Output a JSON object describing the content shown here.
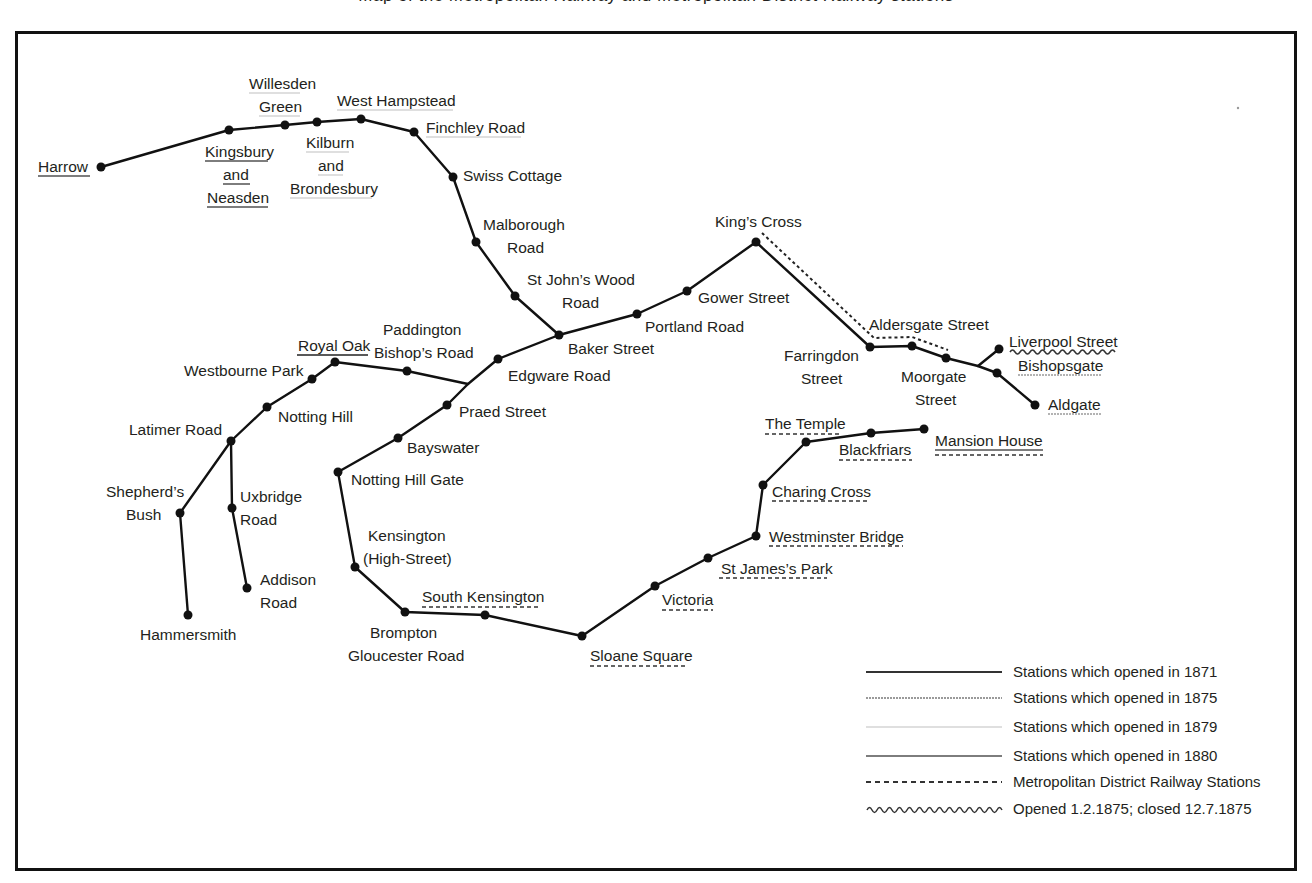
{
  "caption_cropped": "Map of the Metropolitan Railway and Metropolitan District Railway stations",
  "colors": {
    "frame": "#111111",
    "track": "#111111",
    "y1875": "#9a9a9a",
    "y1879": "#d4d4d4",
    "y1880": "#7d7d7d",
    "district_dash": "#333333",
    "closed_wave": "#333333"
  },
  "stations": [
    {
      "name": "Harrow",
      "lines": [
        "Harrow"
      ],
      "opened": "1880"
    },
    {
      "name": "Kingsbury and Neasden",
      "lines": [
        "Kingsbury",
        "and",
        "Neasden"
      ],
      "opened": "1880"
    },
    {
      "name": "Willesden Green",
      "lines": [
        "Willesden",
        "Green"
      ],
      "opened": "1879"
    },
    {
      "name": "Kilburn and Brondesbury",
      "lines": [
        "Kilburn",
        "and",
        "Brondesbury"
      ],
      "opened": "1879"
    },
    {
      "name": "West Hampstead",
      "lines": [
        "West Hampstead"
      ],
      "opened": "1879"
    },
    {
      "name": "Finchley Road",
      "lines": [
        "Finchley Road"
      ],
      "opened": "1879"
    },
    {
      "name": "Swiss Cottage",
      "lines": [
        "Swiss Cottage"
      ],
      "opened": "1871"
    },
    {
      "name": "Malborough Road",
      "lines": [
        "Malborough",
        "Road"
      ],
      "opened": "1871"
    },
    {
      "name": "St John's Wood Road",
      "lines": [
        "St John’s Wood",
        "Road"
      ],
      "opened": "1871"
    },
    {
      "name": "Baker Street",
      "lines": [
        "Baker Street"
      ],
      "opened": "1871"
    },
    {
      "name": "Portland Road",
      "lines": [
        "Portland Road"
      ],
      "opened": "1871"
    },
    {
      "name": "Gower Street",
      "lines": [
        "Gower Street"
      ],
      "opened": "1871"
    },
    {
      "name": "King's Cross",
      "lines": [
        "King’s Cross"
      ],
      "opened": "1871"
    },
    {
      "name": "Farringdon Street",
      "lines": [
        "Farringdon",
        "Street"
      ],
      "opened": "1871"
    },
    {
      "name": "Aldersgate Street",
      "lines": [
        "Aldersgate Street"
      ],
      "opened": "1871"
    },
    {
      "name": "Moorgate Street",
      "lines": [
        "Moorgate",
        "Street"
      ],
      "opened": "1871"
    },
    {
      "name": "Liverpool Street",
      "lines": [
        "Liverpool Street"
      ],
      "opened": "1.2.1875; closed 12.7.1875"
    },
    {
      "name": "Bishopsgate",
      "lines": [
        "Bishopsgate"
      ],
      "opened": "1875"
    },
    {
      "name": "Aldgate",
      "lines": [
        "Aldgate"
      ],
      "opened": "1875"
    },
    {
      "name": "Edgware Road",
      "lines": [
        "Edgware Road"
      ],
      "opened": "1871"
    },
    {
      "name": "Praed Street",
      "lines": [
        "Praed Street"
      ],
      "opened": "1871"
    },
    {
      "name": "Bayswater",
      "lines": [
        "Bayswater"
      ],
      "opened": "1871"
    },
    {
      "name": "Notting Hill Gate",
      "lines": [
        "Notting Hill Gate"
      ],
      "opened": "1871"
    },
    {
      "name": "Kensington (High-Street)",
      "lines": [
        "Kensington",
        "(High-Street)"
      ],
      "opened": "1871"
    },
    {
      "name": "Brompton Gloucester Road",
      "lines": [
        "Brompton",
        "Gloucester Road"
      ],
      "opened": "1871"
    },
    {
      "name": "South Kensington",
      "lines": [
        "South Kensington"
      ],
      "opened": "District"
    },
    {
      "name": "Sloane Square",
      "lines": [
        "Sloane Square"
      ],
      "opened": "District"
    },
    {
      "name": "Victoria",
      "lines": [
        "Victoria"
      ],
      "opened": "District"
    },
    {
      "name": "St James's Park",
      "lines": [
        "St James’s Park"
      ],
      "opened": "District"
    },
    {
      "name": "Westminster Bridge",
      "lines": [
        "Westminster Bridge"
      ],
      "opened": "District"
    },
    {
      "name": "Charing Cross",
      "lines": [
        "Charing Cross"
      ],
      "opened": "District"
    },
    {
      "name": "The Temple",
      "lines": [
        "The Temple"
      ],
      "opened": "District"
    },
    {
      "name": "Blackfriars",
      "lines": [
        "Blackfriars"
      ],
      "opened": "District"
    },
    {
      "name": "Mansion House",
      "lines": [
        "Mansion House"
      ],
      "opened": "District; 1880"
    },
    {
      "name": "Royal Oak",
      "lines": [
        "Royal Oak"
      ],
      "opened": "1871-other"
    },
    {
      "name": "Paddington Bishop's Road",
      "lines": [
        "Paddington",
        "Bishop’s Road"
      ],
      "opened": "1871"
    },
    {
      "name": "Westbourne Park",
      "lines": [
        "Westbourne Park"
      ],
      "opened": "1871"
    },
    {
      "name": "Notting Hill",
      "lines": [
        "Notting Hill"
      ],
      "opened": "1871"
    },
    {
      "name": "Latimer Road",
      "lines": [
        "Latimer Road"
      ],
      "opened": "1871"
    },
    {
      "name": "Shepherd's Bush",
      "lines": [
        "Shepherd’s",
        "Bush"
      ],
      "opened": "1871"
    },
    {
      "name": "Hammersmith",
      "lines": [
        "Hammersmith"
      ],
      "opened": "1871"
    },
    {
      "name": "Uxbridge Road",
      "lines": [
        "Uxbridge",
        "Road"
      ],
      "opened": "1871"
    },
    {
      "name": "Addison Road",
      "lines": [
        "Addison",
        "Road"
      ],
      "opened": "1871"
    }
  ],
  "legend": {
    "items": [
      {
        "style": "solid-black",
        "label": "Stations which opened in 1871"
      },
      {
        "style": "solid-grey-1875",
        "label": "Stations which opened in 1875"
      },
      {
        "style": "solid-light-1879",
        "label": "Stations which opened in 1879"
      },
      {
        "style": "solid-grey-1880",
        "label": "Stations which opened in 1880"
      },
      {
        "style": "dashed",
        "label": "Metropolitan District Railway Stations"
      },
      {
        "style": "wavy",
        "label": "Opened 1.2.1875; closed 12.7.1875"
      }
    ]
  }
}
